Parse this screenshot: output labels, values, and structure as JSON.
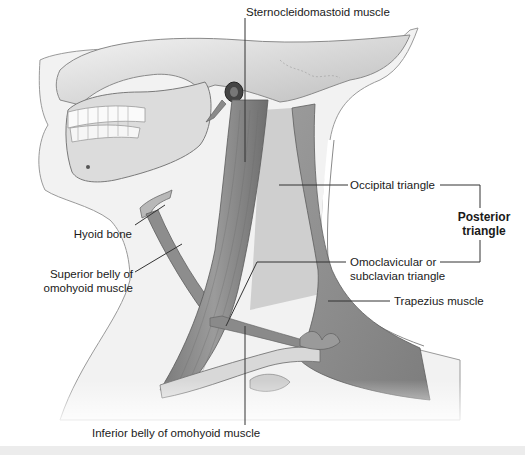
{
  "figure": {
    "labels": {
      "sternocleidomastoid": "Sternocleidomastoid muscle",
      "occipital_triangle": "Occipital triangle",
      "posterior_triangle_line1": "Posterior",
      "posterior_triangle_line2": "triangle",
      "hyoid_bone": "Hyoid bone",
      "superior_belly_line1": "Superior belly of",
      "superior_belly_line2": "omohyoid muscle",
      "omoclavicular_line1": "Omoclavicular or",
      "omoclavicular_line2": "subclavian triangle",
      "trapezius": "Trapezius muscle",
      "inferior_belly": "Inferior belly of omohyoid muscle"
    },
    "colors": {
      "muscle": "#8e8e8e",
      "muscle_dark": "#6f6f6f",
      "bone": "#d9d9d9",
      "triangle_fill": "#c9c9c9",
      "leader_line": "#333333",
      "text": "#1a1a1a"
    }
  }
}
